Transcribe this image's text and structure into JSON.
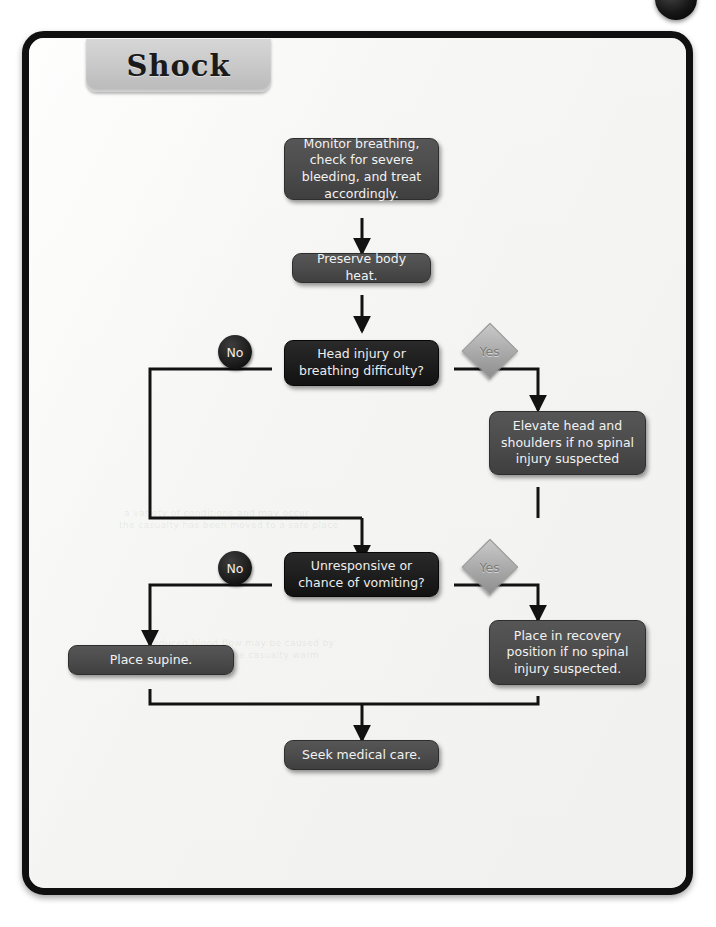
{
  "page": {
    "title": "Shock",
    "corner_marker": "spiral-binding-dot"
  },
  "ghost_text": [
    "a variety of conditions and may occur",
    "the casualty has been moved to a safe place",
    "reduced blood flow may be caused by",
    "position and keep the casualty warm"
  ],
  "flowchart": {
    "type": "flowchart",
    "nodes": [
      {
        "id": "n1",
        "kind": "process",
        "label": "Monitor breathing, check for severe bleeding, and treat accordingly."
      },
      {
        "id": "n2",
        "kind": "process",
        "label": "Preserve body heat."
      },
      {
        "id": "n3",
        "kind": "decision",
        "label": "Head injury or breathing difficulty?"
      },
      {
        "id": "n4",
        "kind": "process",
        "label": "Elevate head and shoulders if no spinal injury suspected"
      },
      {
        "id": "n5",
        "kind": "decision",
        "label": "Unresponsive or chance of vomiting?"
      },
      {
        "id": "n6",
        "kind": "process",
        "label": "Place supine."
      },
      {
        "id": "n7",
        "kind": "process",
        "label": "Place in recovery position if no spinal injury suspected."
      },
      {
        "id": "n8",
        "kind": "process",
        "label": "Seek medical care."
      }
    ],
    "branch_markers": [
      {
        "id": "m1",
        "kind": "no",
        "label": "No",
        "from": "n3"
      },
      {
        "id": "m2",
        "kind": "yes",
        "label": "Yes",
        "from": "n3"
      },
      {
        "id": "m3",
        "kind": "no",
        "label": "No",
        "from": "n5"
      },
      {
        "id": "m4",
        "kind": "yes",
        "label": "Yes",
        "from": "n5"
      }
    ],
    "edges": [
      {
        "from": "n1",
        "to": "n2",
        "label": ""
      },
      {
        "from": "n2",
        "to": "n3",
        "label": ""
      },
      {
        "from": "n3",
        "to": "n5",
        "label": "No"
      },
      {
        "from": "n3",
        "to": "n4",
        "label": "Yes"
      },
      {
        "from": "n4",
        "to": "n5",
        "label": ""
      },
      {
        "from": "n5",
        "to": "n6",
        "label": "No"
      },
      {
        "from": "n5",
        "to": "n7",
        "label": "Yes"
      },
      {
        "from": "n6",
        "to": "n8",
        "label": ""
      },
      {
        "from": "n7",
        "to": "n8",
        "label": ""
      }
    ]
  },
  "colors": {
    "page_border": "#101010",
    "page_background": "#f4f4f2",
    "process_node": "#4c4c4c",
    "decision_node": "#1e1e1e",
    "marker_no": "#1c1c1c",
    "marker_yes": "#aeaeae",
    "connector": "#121212",
    "title_tab": "#c9c9c9"
  }
}
